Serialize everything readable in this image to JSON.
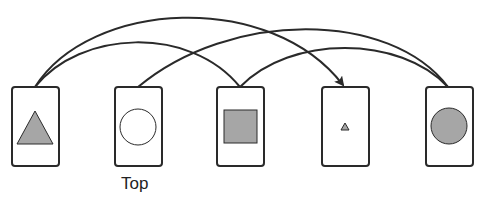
{
  "colors": {
    "stroke": "#2a2a2a",
    "fill": "#a6a6a6",
    "background": "#ffffff"
  },
  "cards": [
    {
      "id": "card-1",
      "x": 12,
      "shape": "triangle-large"
    },
    {
      "id": "card-2",
      "x": 115,
      "shape": "circle-empty",
      "label": "Top"
    },
    {
      "id": "card-3",
      "x": 217,
      "shape": "square"
    },
    {
      "id": "card-4",
      "x": 322,
      "shape": "triangle-small"
    },
    {
      "id": "card-5",
      "x": 426,
      "shape": "circle-filled"
    }
  ],
  "arcs": [
    {
      "from": "card-1",
      "to": "card-4",
      "arrow": true
    },
    {
      "from": "card-1",
      "to": "card-3",
      "arrow": false
    },
    {
      "from": "card-2",
      "to": "card-5",
      "arrow": false
    },
    {
      "from": "card-3",
      "to": "card-5",
      "arrow": false
    }
  ],
  "labels": {
    "top": "Top"
  }
}
